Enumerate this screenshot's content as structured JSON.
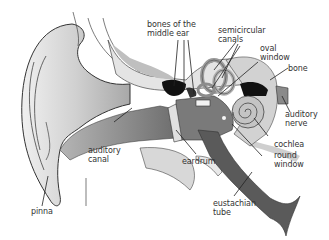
{
  "diagram": {
    "colors": {
      "skin_light": "#e6e6e6",
      "skin_mid": "#c8c8c8",
      "canal": "#8a8a8a",
      "tube": "#555555",
      "outline": "#333333",
      "dark": "#111111"
    },
    "labels": [
      {
        "id": "bones-middle-ear",
        "text": "bones of the\nmiddle ear"
      },
      {
        "id": "semicircular-canals",
        "text": "semicircular\ncanals"
      },
      {
        "id": "oval-window",
        "text": "oval\nwindow"
      },
      {
        "id": "bone",
        "text": "bone"
      },
      {
        "id": "auditory-nerve",
        "text": "auditory\nnerve"
      },
      {
        "id": "auditory-canal",
        "text": "auditory\ncanal"
      },
      {
        "id": "eardrum",
        "text": "eardrum"
      },
      {
        "id": "cochlea",
        "text": "cochlea"
      },
      {
        "id": "round-window",
        "text": "round\nwindow"
      },
      {
        "id": "pinna",
        "text": "pinna"
      },
      {
        "id": "eustachian-tube",
        "text": "eustachian\ntube"
      }
    ]
  }
}
